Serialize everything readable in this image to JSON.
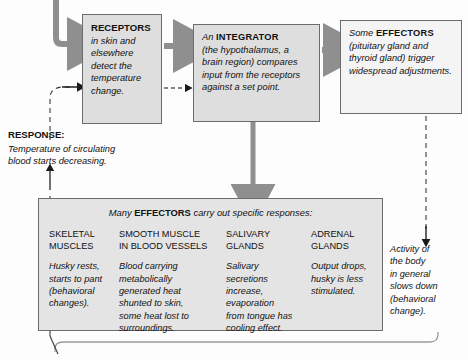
{
  "diagram": {
    "colors": {
      "box_fill": "#dedede",
      "box_fill_light": "#f4f4f4",
      "box_border": "#6c6c6c",
      "arrow_gray": "#8f8f8f",
      "arrow_black": "#1a1a1a",
      "panel_fill": "#e4e4e4"
    }
  },
  "receptors_box": {
    "heading": "RECEPTORS",
    "body": "in skin and elsewhere detect the temperature change."
  },
  "integrator_box": {
    "lead": "An ",
    "heading": "INTEGRATOR",
    "body": "(the hypothalamus, a brain region) compares input from the receptors against a set point."
  },
  "effectors_box": {
    "lead": "Some ",
    "heading": "EFFECTORS",
    "body": "(pituitary gland and thyroid gland) trigger widespread adjustments."
  },
  "response": {
    "heading": "RESPONSE:",
    "body": "Temperature of circulating\nblood starts decreasing."
  },
  "panel": {
    "title_lead": "Many ",
    "title_bold": "EFFECTORS",
    "title_tail": " carry out specific responses:",
    "columns": [
      {
        "header": "SKELETAL\nMUSCLES",
        "body": "Husky rests,\nstarts to pant\n(behavioral\nchanges)."
      },
      {
        "header": "SMOOTH MUSCLE\nIN BLOOD VESSELS",
        "body": "Blood carrying\nmetabolically\ngenerated heat\nshunted to skin,\nsome heat lost to\nsurroundings."
      },
      {
        "header": "SALIVARY\nGLANDS",
        "body": "Salivary\nsecretions\nincrease,\nevaporation\nfrom tongue has\ncooling effect."
      },
      {
        "header": "ADRENAL\nGLANDS",
        "body": "Output drops,\nhusky is less\nstimulated."
      }
    ]
  },
  "activity_note": {
    "text": "Activity of\nthe body\nin general\nslows down\n(behavioral\nchange)."
  }
}
